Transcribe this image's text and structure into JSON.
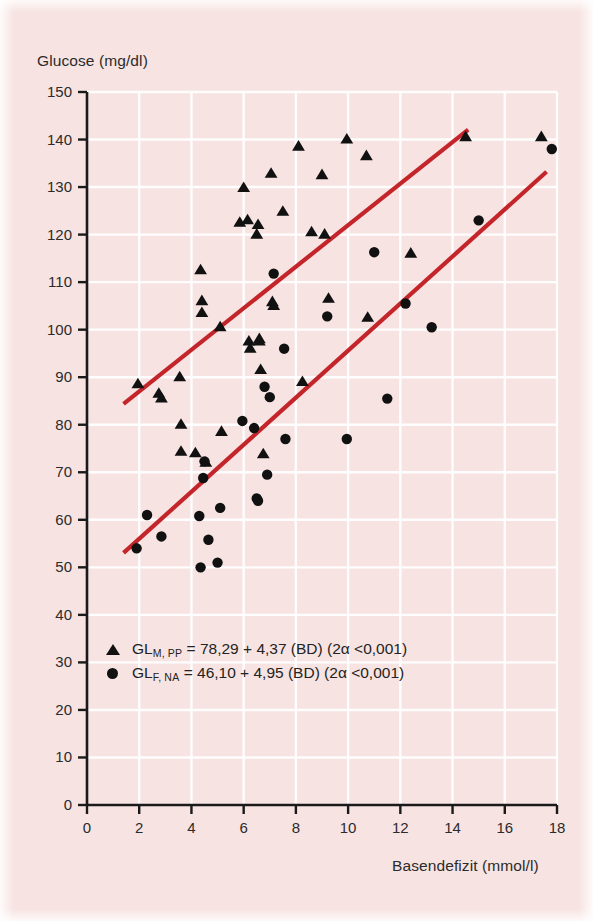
{
  "chart_data": {
    "type": "scatter",
    "title": "",
    "xlabel": "Basendefizit (mmol/l)",
    "ylabel": "Glucose (mg/dl)",
    "xlim": [
      0,
      18
    ],
    "ylim": [
      0,
      150
    ],
    "xticks": [
      0,
      2,
      4,
      6,
      8,
      10,
      12,
      14,
      16,
      18
    ],
    "yticks": [
      0,
      10,
      20,
      30,
      40,
      50,
      60,
      70,
      80,
      90,
      100,
      110,
      120,
      130,
      140,
      150
    ],
    "grid": true,
    "grid_color": "#ffffff",
    "background_color": "#f7e4e2",
    "marker_color": "#111111",
    "regression_color": "#c4252a",
    "legend_position": "lower-left",
    "series": [
      {
        "name": "GL M, PP",
        "marker": "triangle",
        "color": "#111111",
        "points": [
          [
            1.95,
            88.5
          ],
          [
            2.75,
            86.5
          ],
          [
            2.85,
            85.5
          ],
          [
            3.55,
            90.0
          ],
          [
            3.6,
            80.0
          ],
          [
            3.6,
            74.3
          ],
          [
            4.15,
            74.0
          ],
          [
            4.35,
            112.5
          ],
          [
            4.4,
            106.0
          ],
          [
            4.4,
            103.5
          ],
          [
            4.55,
            72.0
          ],
          [
            5.1,
            100.5
          ],
          [
            5.15,
            78.5
          ],
          [
            5.85,
            122.5
          ],
          [
            6.0,
            129.8
          ],
          [
            6.15,
            123.0
          ],
          [
            6.2,
            97.5
          ],
          [
            6.25,
            96.0
          ],
          [
            6.5,
            120.0
          ],
          [
            6.55,
            122.0
          ],
          [
            6.6,
            98.0
          ],
          [
            6.6,
            97.5
          ],
          [
            6.65,
            91.5
          ],
          [
            6.75,
            73.8
          ],
          [
            7.05,
            132.8
          ],
          [
            7.1,
            105.8
          ],
          [
            7.15,
            105.0
          ],
          [
            7.5,
            124.8
          ],
          [
            8.1,
            138.5
          ],
          [
            8.25,
            89.0
          ],
          [
            8.6,
            120.5
          ],
          [
            9.0,
            132.5
          ],
          [
            9.1,
            120.0
          ],
          [
            9.25,
            106.5
          ],
          [
            9.95,
            140.0
          ],
          [
            10.7,
            136.5
          ],
          [
            10.75,
            102.5
          ],
          [
            12.4,
            116.0
          ],
          [
            14.5,
            140.5
          ],
          [
            17.4,
            140.5
          ]
        ]
      },
      {
        "name": "GL F, NA",
        "marker": "circle",
        "color": "#111111",
        "points": [
          [
            1.9,
            54.0
          ],
          [
            2.3,
            61.0
          ],
          [
            2.85,
            56.5
          ],
          [
            4.3,
            60.8
          ],
          [
            4.35,
            50.0
          ],
          [
            4.45,
            68.8
          ],
          [
            4.5,
            72.3
          ],
          [
            4.65,
            55.8
          ],
          [
            5.0,
            51.0
          ],
          [
            5.1,
            62.5
          ],
          [
            5.95,
            80.8
          ],
          [
            6.4,
            79.3
          ],
          [
            6.5,
            64.5
          ],
          [
            6.55,
            64.0
          ],
          [
            6.8,
            88.0
          ],
          [
            6.9,
            69.5
          ],
          [
            7.0,
            85.8
          ],
          [
            7.15,
            111.8
          ],
          [
            7.55,
            96.0
          ],
          [
            7.6,
            77.0
          ],
          [
            9.2,
            102.8
          ],
          [
            9.95,
            77.0
          ],
          [
            11.0,
            116.3
          ],
          [
            11.5,
            85.5
          ],
          [
            12.2,
            105.5
          ],
          [
            13.2,
            100.5
          ],
          [
            15.0,
            123.0
          ],
          [
            17.8,
            138.0
          ]
        ]
      }
    ],
    "regression_lines": [
      {
        "name": "GL M, PP",
        "equation": "GL M, PP = 78,29 + 4,37 (BD)",
        "intercept": 78.29,
        "slope": 4.37,
        "x_start": 1.4,
        "x_end": 14.6,
        "color": "#c4252a"
      },
      {
        "name": "GL F, NA",
        "equation": "GL F, NA = 46,10 + 4,95 (BD)",
        "intercept": 46.1,
        "slope": 4.95,
        "x_start": 1.4,
        "x_end": 17.6,
        "color": "#c4252a"
      }
    ],
    "legend_entries": [
      {
        "marker": "triangle",
        "prefix": "GL",
        "subscript": "M, PP",
        "equation": " = 78,29 + 4,37 (BD) (2α <0,001)"
      },
      {
        "marker": "circle",
        "prefix": "GL",
        "subscript": "F, NA",
        "equation": " = 46,10 + 4,95 (BD) (2α <0,001)"
      }
    ]
  }
}
